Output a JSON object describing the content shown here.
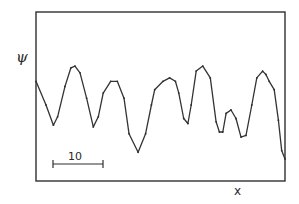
{
  "chart_data": {
    "type": "line",
    "title": "",
    "xlabel": "x",
    "ylabel": "ψ",
    "grid": false,
    "legend": null,
    "axis_ticks": false,
    "scale_bar": {
      "label": "10",
      "length_units": 10,
      "orientation": "horizontal"
    },
    "series": [
      {
        "name": "ψ(x)",
        "marker": "small dots",
        "color": "#3a3a3a",
        "x": [
          0,
          2.4,
          4.2,
          5.2,
          7.0,
          8.4,
          9.4,
          10.6,
          12.2,
          13.8,
          15.0,
          16.2,
          18.0,
          19.6,
          21.2,
          22.4,
          24.6,
          26.4,
          27.8,
          28.6,
          30.6,
          32.2,
          33.6,
          34.4,
          35.6,
          36.6,
          37.4,
          38.6,
          40.2,
          42.0,
          43.4,
          44.2,
          45.0,
          45.8,
          47.0,
          48.2,
          49.4
        ],
        "pixel_y": [
          73,
          88,
          102,
          96,
          76,
          63,
          62,
          66,
          84,
          103,
          96,
          80,
          72,
          72,
          84,
          108,
          120,
          108,
          88,
          78,
          72,
          70,
          72,
          80,
          98,
          101,
          88,
          66,
          62,
          70,
          100,
          107,
          107,
          94,
          92,
          98,
          110
        ],
        "y_relative": [
          0.59,
          0.45,
          0.33,
          0.38,
          0.56,
          0.67,
          0.68,
          0.64,
          0.49,
          0.32,
          0.38,
          0.52,
          0.59,
          0.59,
          0.49,
          0.28,
          0.17,
          0.28,
          0.45,
          0.54,
          0.59,
          0.61,
          0.59,
          0.52,
          0.37,
          0.34,
          0.45,
          0.65,
          0.68,
          0.61,
          0.35,
          0.29,
          0.29,
          0.4,
          0.42,
          0.37,
          0.26
        ]
      },
      {
        "name": "ψ(x) continued",
        "x": [
          49.4,
          50.6,
          52.0,
          53.2,
          54.6,
          55.4,
          56.2,
          57.4,
          58.4,
          59.2,
          60.0
        ],
        "y_relative": [
          0.26,
          0.27,
          0.45,
          0.61,
          0.65,
          0.63,
          0.59,
          0.54,
          0.36,
          0.18,
          0.13
        ]
      }
    ],
    "x_range_units_approx": [
      0,
      50
    ],
    "note": "No numeric axes; only a horizontal scale bar of length 10 in x units. y values are relative positions within the frame (0 = bottom, 1 = top)."
  },
  "labels": {
    "y_axis": "ψ",
    "x_axis": "x",
    "scale_bar": "10"
  },
  "colors": {
    "ink": "#2f2f2f",
    "background": "#ffffff"
  }
}
